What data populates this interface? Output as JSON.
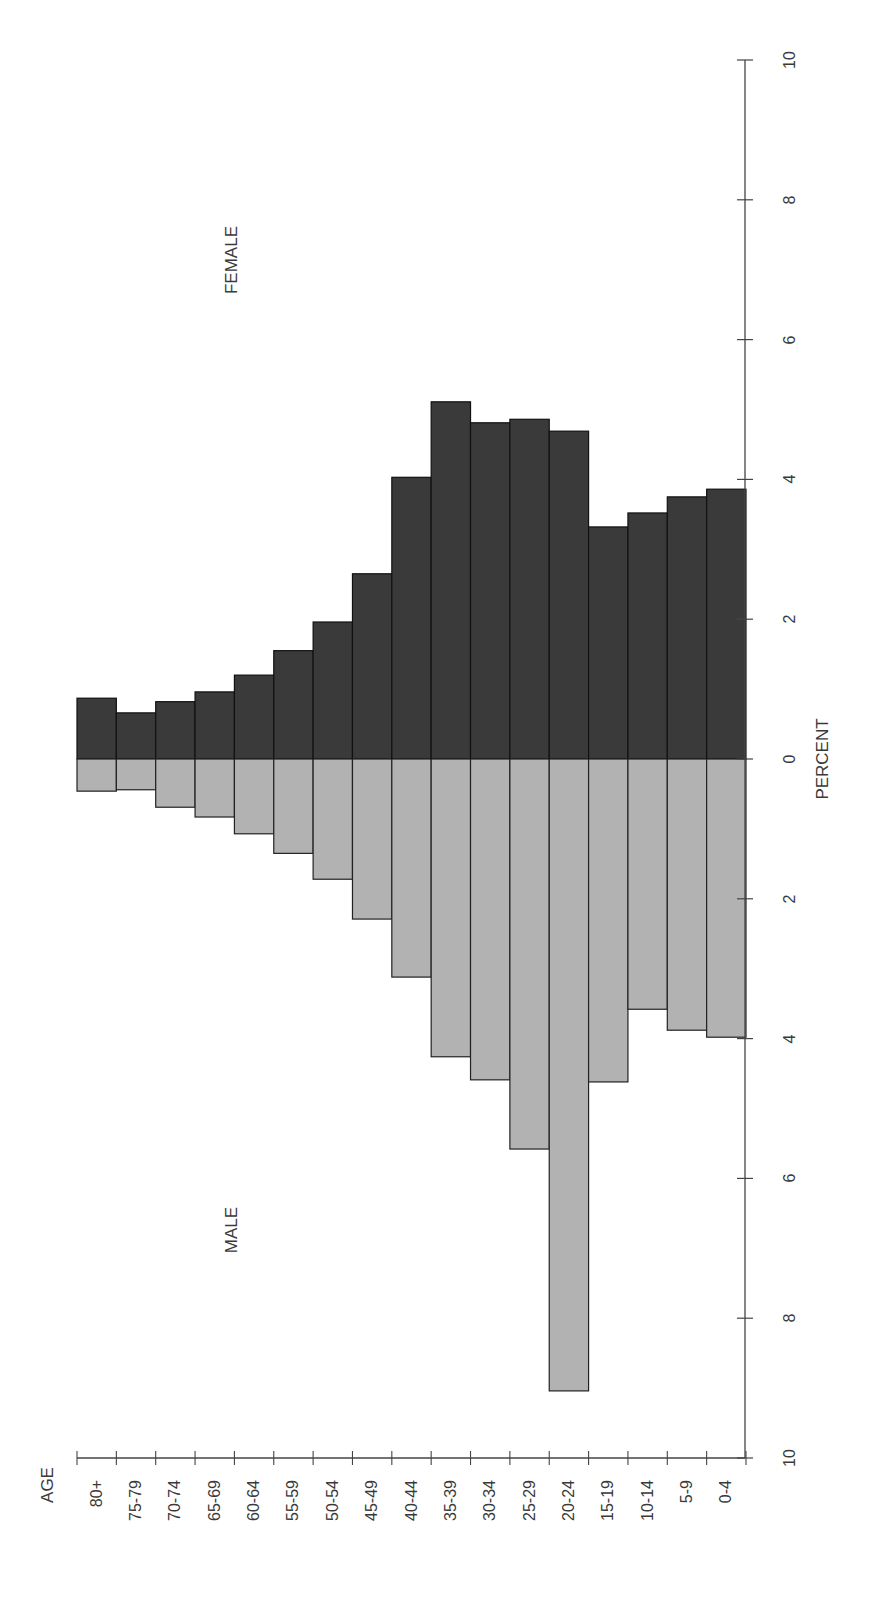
{
  "chart_data": {
    "type": "bar",
    "orientation": "population-pyramid (rotated 90°)",
    "title": "",
    "xlabel": "AGE",
    "ylabel": "PERCENT",
    "categories": [
      "80+",
      "75-79",
      "70-74",
      "65-69",
      "60-64",
      "55-59",
      "50-54",
      "45-49",
      "40-44",
      "35-39",
      "30-34",
      "25-29",
      "20-24",
      "15-19",
      "10-14",
      "5-9",
      "0-4"
    ],
    "series": [
      {
        "name": "FEMALE",
        "color": "#3a3a3a",
        "values": [
          0.87,
          0.66,
          0.82,
          0.96,
          1.2,
          1.55,
          1.96,
          2.65,
          4.03,
          5.11,
          4.81,
          4.86,
          4.69,
          3.32,
          3.52,
          3.75,
          3.86
        ]
      },
      {
        "name": "MALE",
        "color": "#b2b2b2",
        "values": [
          0.46,
          0.44,
          0.69,
          0.83,
          1.07,
          1.35,
          1.72,
          2.29,
          3.12,
          4.26,
          4.59,
          5.58,
          9.04,
          4.62,
          3.58,
          3.88,
          3.98
        ]
      }
    ],
    "ylim": [
      -10,
      10
    ],
    "percent_ticks": [
      "10",
      "8",
      "6",
      "4",
      "2",
      "0",
      "2",
      "4",
      "6",
      "8",
      "10"
    ],
    "grid": false,
    "legend": "inline labels (FEMALE / MALE)"
  },
  "labels": {
    "female": "FEMALE",
    "male": "MALE",
    "percent": "PERCENT",
    "age": "AGE"
  }
}
